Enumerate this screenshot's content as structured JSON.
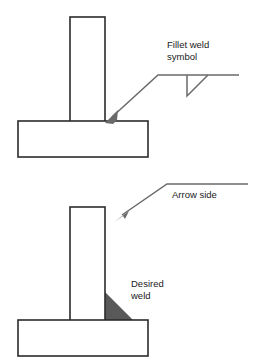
{
  "figure": {
    "background_color": "#ffffff",
    "outline_color": "#2b2b2b",
    "leader_color": "#6a6a6a",
    "weld_fill_color": "#595959",
    "text_color": "#1a1a1a"
  },
  "labels": {
    "fillet_weld_line1": "Fillet weld",
    "fillet_weld_line2": "symbol",
    "arrow_side": "Arrow side",
    "desired_line1": "Desired",
    "desired_line2": "weld"
  },
  "upper_diagram": {
    "name": "welding-symbol-notation",
    "vertical_member": {
      "x": 70,
      "y": 17,
      "width": 35,
      "height": 105
    },
    "base_plate": {
      "x": 18,
      "y": 121,
      "width": 130,
      "height": 36
    },
    "leader": {
      "arrow_tip_x": 106,
      "arrow_tip_y": 122,
      "elbow_x": 158,
      "elbow_y": 75,
      "reference_line_end_x": 239,
      "reference_line_y": 75
    },
    "fillet_symbol_triangle": {
      "apex_x": 187,
      "top_y": 75,
      "bottom_y": 96,
      "right_x": 208
    }
  },
  "lower_diagram": {
    "name": "actual-weld-illustration",
    "vertical_member": {
      "x": 70,
      "y": 207,
      "width": 35,
      "height": 114
    },
    "base_plate": {
      "x": 18,
      "y": 320,
      "width": 130,
      "height": 36
    },
    "weld_triangle": {
      "vertical_leg_x": 105,
      "top_y": 292,
      "bottom_y": 320,
      "toe_x": 133
    },
    "leader": {
      "arrow_tip_x": 117,
      "arrow_tip_y": 219,
      "elbow_x": 167,
      "elbow_y": 184,
      "reference_line_end_x": 248,
      "reference_line_y": 184
    }
  },
  "text_positions": {
    "fillet_weld_line1": {
      "x": 167,
      "y": 48
    },
    "fillet_weld_line2": {
      "x": 167,
      "y": 60
    },
    "arrow_side": {
      "x": 172,
      "y": 198
    },
    "desired_line1": {
      "x": 131,
      "y": 287
    },
    "desired_line2": {
      "x": 131,
      "y": 299
    }
  }
}
